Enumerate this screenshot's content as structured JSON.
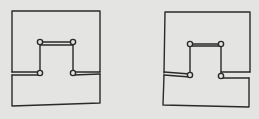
{
  "diagram": {
    "background": "#e4e4e2",
    "stroke_color": "#2a2a2a",
    "figures": [
      {
        "name": "left-figure",
        "description": "Square outline with inner U-shaped notch; hinged arms at left, wedge gap at right",
        "outer_path": "M12,72 L12,11 L100,11 L100,72",
        "outer_lower_path": "M12,75 L12,106 L100,103 L100,74",
        "arm_left": "M12,72 L40,72 M12,75 L40,75",
        "arm_right_wedge": "M73,72 L100,72 M73,75 L100,74",
        "inner_path": "M40,73 L40,42 L73,42 L73,73 M40,45 L73,45",
        "joints": [
          [
            40,
            42
          ],
          [
            73,
            42
          ],
          [
            40,
            73
          ],
          [
            73,
            73
          ]
        ]
      },
      {
        "name": "right-figure",
        "description": "Mirror variant: wedge gap at left, hinged arm at right",
        "outer_path": "M164,73 L165,12 L250,12 L250,72",
        "outer_lower_path": "M164,75 L163,105 L249,107 L249,78",
        "arm_left_wedge": "M164,72 L190,74 M164,75 L190,77",
        "arm_right": "M221,72 L250,72 M221,78 L249,78",
        "inner_path": "M190,75 L190,44 L221,44 L221,76 M190,46 L221,46",
        "joints": [
          [
            190,
            44
          ],
          [
            221,
            44
          ],
          [
            190,
            75
          ],
          [
            221,
            76
          ]
        ]
      }
    ]
  }
}
